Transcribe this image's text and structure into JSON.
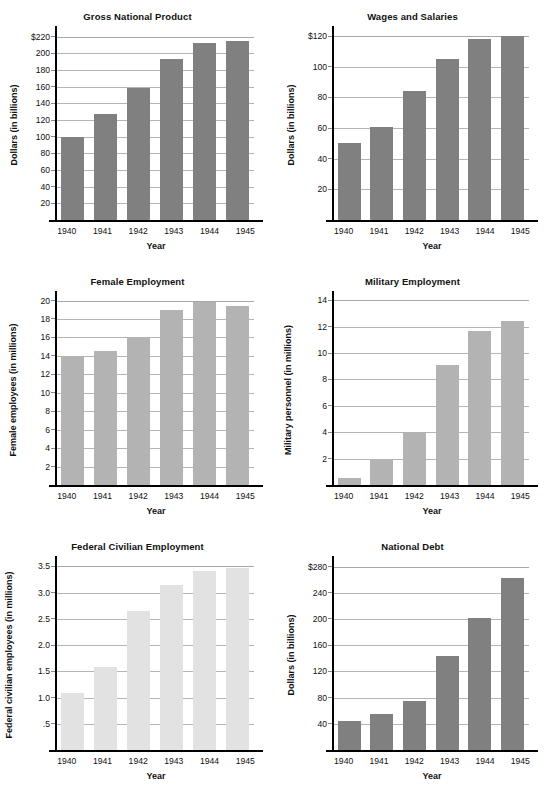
{
  "page": {
    "background": "#ffffff",
    "bar_color_dark": "#808080",
    "bar_color_mid": "#b3b3b3",
    "bar_color_light": "#e2e2e2",
    "gridline_color": "#b4b4b4",
    "axis_color": "#000000"
  },
  "chart_data": [
    {
      "type": "bar",
      "title": "Gross National Product",
      "xlabel": "Year",
      "ylabel": "Dollars (in billions)",
      "categories": [
        "1940",
        "1941",
        "1942",
        "1943",
        "1944",
        "1945"
      ],
      "values": [
        100,
        127,
        158,
        193,
        212,
        215
      ],
      "ylim": [
        0,
        228
      ],
      "yticks": [
        20,
        40,
        60,
        80,
        100,
        120,
        140,
        160,
        180,
        200,
        220
      ],
      "yticklabels": [
        "20",
        "40",
        "60",
        "80",
        "100",
        "120",
        "140",
        "160",
        "180",
        "200",
        "$220"
      ],
      "grid": true,
      "legend": "none",
      "bar_color": "#808080"
    },
    {
      "type": "bar",
      "title": "Wages and Salaries",
      "xlabel": "Year",
      "ylabel": "Dollars (in billions)",
      "categories": [
        "1940",
        "1941",
        "1942",
        "1943",
        "1944",
        "1945"
      ],
      "values": [
        50,
        61,
        84,
        105,
        118,
        120
      ],
      "ylim": [
        0,
        124
      ],
      "yticks": [
        20,
        40,
        60,
        80,
        100,
        120
      ],
      "yticklabels": [
        "20",
        "40",
        "60",
        "80",
        "100",
        "$120"
      ],
      "grid": true,
      "legend": "none",
      "bar_color": "#808080"
    },
    {
      "type": "bar",
      "title": "Female Employment",
      "xlabel": "Year",
      "ylabel": "Female employees (in millions)",
      "categories": [
        "1940",
        "1941",
        "1942",
        "1943",
        "1944",
        "1945"
      ],
      "values": [
        14.0,
        14.5,
        16.0,
        19.0,
        19.8,
        19.4
      ],
      "ylim": [
        0,
        20.6
      ],
      "yticks": [
        2,
        4,
        6,
        8,
        10,
        12,
        14,
        16,
        18,
        20
      ],
      "yticklabels": [
        "2",
        "4",
        "6",
        "8",
        "10",
        "12",
        "14",
        "16",
        "18",
        "20"
      ],
      "grid": true,
      "legend": "none",
      "bar_color": "#b3b3b3"
    },
    {
      "type": "bar",
      "title": "Military Employment",
      "xlabel": "Year",
      "ylabel": "Military personnel (in millions)",
      "categories": [
        "1940",
        "1941",
        "1942",
        "1943",
        "1944",
        "1945"
      ],
      "values": [
        0.5,
        2.0,
        4.0,
        9.1,
        11.7,
        12.4
      ],
      "ylim": [
        0,
        14.4
      ],
      "yticks": [
        2,
        4,
        6,
        8,
        10,
        12,
        14
      ],
      "yticklabels": [
        "2",
        "4",
        "6",
        "8",
        "10",
        "12",
        "14"
      ],
      "grid": true,
      "legend": "none",
      "bar_color": "#b3b3b3"
    },
    {
      "type": "bar",
      "title": "Federal Civilian Employment",
      "xlabel": "Year",
      "ylabel": "Federal civilian employees (in millions)",
      "categories": [
        "1940",
        "1941",
        "1942",
        "1943",
        "1944",
        "1945"
      ],
      "values": [
        1.08,
        1.58,
        2.65,
        3.15,
        3.41,
        3.47
      ],
      "ylim": [
        0,
        3.62
      ],
      "yticks": [
        0.5,
        1.0,
        1.5,
        2.0,
        2.5,
        3.0,
        3.5
      ],
      "yticklabels": [
        ".5",
        "1.0",
        "1.5",
        "2.0",
        "2.5",
        "3.0",
        "3.5"
      ],
      "grid": true,
      "legend": "none",
      "bar_color": "#e2e2e2"
    },
    {
      "type": "bar",
      "title": "National Debt",
      "xlabel": "Year",
      "ylabel": "Dollars (in billions)",
      "categories": [
        "1940",
        "1941",
        "1942",
        "1943",
        "1944",
        "1945"
      ],
      "values": [
        45,
        55,
        75,
        143,
        201,
        263
      ],
      "ylim": [
        0,
        290
      ],
      "yticks": [
        40,
        80,
        120,
        160,
        200,
        240,
        280
      ],
      "yticklabels": [
        "40",
        "80",
        "120",
        "160",
        "200",
        "240",
        "$280"
      ],
      "grid": true,
      "legend": "none",
      "bar_color": "#808080"
    }
  ]
}
